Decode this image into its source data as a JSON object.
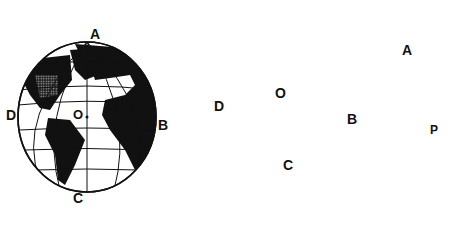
{
  "figure": {
    "globe": {
      "labels": {
        "top": "A",
        "right": "B",
        "bottom": "C",
        "left": "D",
        "center": "O"
      }
    },
    "map": {
      "labels": {
        "a": "A",
        "b": "B",
        "c": "C",
        "d": "D",
        "o": "O",
        "p": "P"
      }
    }
  },
  "colors": {
    "land": "#111111",
    "ocean": "#ffffff",
    "stipple": "#9a9a9a",
    "frame": "#111111"
  }
}
